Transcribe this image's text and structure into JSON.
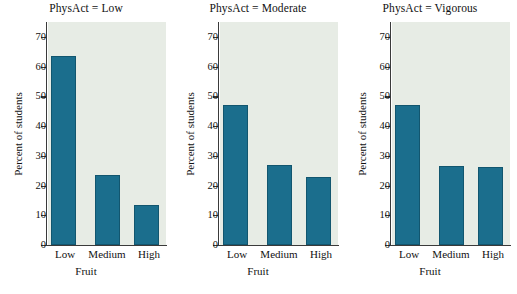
{
  "figure": {
    "ylabel": "Percent of students",
    "xlabel": "Fruit",
    "bar_color": "#1b6e8d",
    "panel_bg": "#e7ece5"
  },
  "chart_data": {
    "type": "bar",
    "title": "",
    "xlabel": "Fruit",
    "ylabel": "Percent of students",
    "ylim": [
      0,
      75
    ],
    "yticks": [
      0,
      10,
      20,
      30,
      40,
      50,
      60,
      70
    ],
    "ytick_labels": [
      "0",
      "10",
      "20",
      "30",
      "40",
      "50",
      "60",
      "70"
    ],
    "categories": [
      "Low",
      "Medium",
      "High"
    ],
    "grid": false,
    "legend": "none",
    "panels": [
      {
        "title": "PhysAct = Low",
        "categories": [
          "Low",
          "Medium",
          "High"
        ],
        "values": [
          63.5,
          23.5,
          13.5
        ]
      },
      {
        "title": "PhysAct = Moderate",
        "categories": [
          "Low",
          "Medium",
          "High"
        ],
        "values": [
          47.0,
          27.0,
          22.8
        ]
      },
      {
        "title": "PhysAct = Vigorous",
        "categories": [
          "Low",
          "Medium",
          "High"
        ],
        "values": [
          47.0,
          26.7,
          26.3
        ]
      }
    ]
  }
}
